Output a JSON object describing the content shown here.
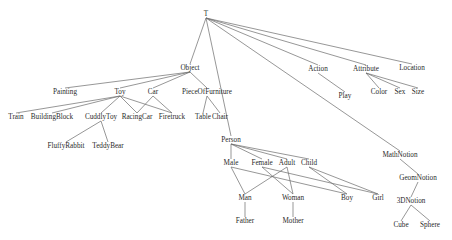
{
  "diagram": {
    "type": "concept-hierarchy-dag",
    "root": "T",
    "nodes": [
      {
        "id": "T",
        "label": "T",
        "x": 206,
        "y": 14
      },
      {
        "id": "Object",
        "label": "Object",
        "x": 190,
        "y": 68
      },
      {
        "id": "Action",
        "label": "Action",
        "x": 318,
        "y": 69
      },
      {
        "id": "Attribute",
        "label": "Attribute",
        "x": 366,
        "y": 69
      },
      {
        "id": "Location",
        "label": "Location",
        "x": 412,
        "y": 68
      },
      {
        "id": "Play",
        "label": "Play",
        "x": 345,
        "y": 96
      },
      {
        "id": "Color",
        "label": "Color",
        "x": 379,
        "y": 92
      },
      {
        "id": "Sex",
        "label": "Sex",
        "x": 400,
        "y": 92
      },
      {
        "id": "Size",
        "label": "Size",
        "x": 418,
        "y": 92
      },
      {
        "id": "Painting",
        "label": "Painting",
        "x": 65,
        "y": 92
      },
      {
        "id": "Toy",
        "label": "Toy",
        "x": 120,
        "y": 92
      },
      {
        "id": "Car",
        "label": "Car",
        "x": 153,
        "y": 92
      },
      {
        "id": "PieceOfFurniture",
        "label": "PieceOfFurniture",
        "x": 207,
        "y": 92
      },
      {
        "id": "Train",
        "label": "Train",
        "x": 16,
        "y": 117
      },
      {
        "id": "BuildingBlock",
        "label": "BuildingBlock",
        "x": 52,
        "y": 117
      },
      {
        "id": "CuddlyToy",
        "label": "CuddlyToy",
        "x": 101,
        "y": 117
      },
      {
        "id": "RacingCar",
        "label": "RacingCar",
        "x": 137,
        "y": 117
      },
      {
        "id": "Firetruck",
        "label": "Firetruck",
        "x": 172,
        "y": 117
      },
      {
        "id": "Table",
        "label": "Table",
        "x": 203,
        "y": 117
      },
      {
        "id": "Chair",
        "label": "Chair",
        "x": 220,
        "y": 117
      },
      {
        "id": "FluffyRabbit",
        "label": "FluffyRabbit",
        "x": 66,
        "y": 146
      },
      {
        "id": "TeddyBear",
        "label": "TeddyBear",
        "x": 108,
        "y": 146
      },
      {
        "id": "Person",
        "label": "Person",
        "x": 231,
        "y": 140
      },
      {
        "id": "Male",
        "label": "Male",
        "x": 231,
        "y": 163
      },
      {
        "id": "Female",
        "label": "Female",
        "x": 262,
        "y": 163
      },
      {
        "id": "Adult",
        "label": "Adult",
        "x": 287,
        "y": 163
      },
      {
        "id": "Child",
        "label": "Child",
        "x": 309,
        "y": 163
      },
      {
        "id": "Man",
        "label": "Man",
        "x": 245,
        "y": 198
      },
      {
        "id": "Woman",
        "label": "Woman",
        "x": 293,
        "y": 198
      },
      {
        "id": "Boy",
        "label": "Boy",
        "x": 347,
        "y": 198
      },
      {
        "id": "Girl",
        "label": "Girl",
        "x": 378,
        "y": 198
      },
      {
        "id": "Father",
        "label": "Father",
        "x": 245,
        "y": 221
      },
      {
        "id": "Mother",
        "label": "Mother",
        "x": 293,
        "y": 221
      },
      {
        "id": "MathNotion",
        "label": "MathNotion",
        "x": 400,
        "y": 155
      },
      {
        "id": "GeomNotion",
        "label": "GeomNotion",
        "x": 418,
        "y": 178
      },
      {
        "id": "3DNotion",
        "label": "3DNotion",
        "x": 411,
        "y": 201
      },
      {
        "id": "Cube",
        "label": "Cube",
        "x": 401,
        "y": 225
      },
      {
        "id": "Sphere",
        "label": "Sphere",
        "x": 430,
        "y": 225
      }
    ],
    "edges": [
      [
        "T",
        "Object"
      ],
      [
        "T",
        "Action"
      ],
      [
        "T",
        "Attribute"
      ],
      [
        "T",
        "Location"
      ],
      [
        "T",
        "Person"
      ],
      [
        "T",
        "MathNotion"
      ],
      [
        "Object",
        "Painting"
      ],
      [
        "Object",
        "Toy"
      ],
      [
        "Object",
        "Car"
      ],
      [
        "Object",
        "PieceOfFurniture"
      ],
      [
        "Action",
        "Play"
      ],
      [
        "Attribute",
        "Color"
      ],
      [
        "Attribute",
        "Sex"
      ],
      [
        "Attribute",
        "Size"
      ],
      [
        "Toy",
        "Train"
      ],
      [
        "Toy",
        "BuildingBlock"
      ],
      [
        "Toy",
        "CuddlyToy"
      ],
      [
        "Toy",
        "RacingCar"
      ],
      [
        "Toy",
        "Firetruck"
      ],
      [
        "Car",
        "RacingCar"
      ],
      [
        "Car",
        "Firetruck"
      ],
      [
        "PieceOfFurniture",
        "Table"
      ],
      [
        "PieceOfFurniture",
        "Chair"
      ],
      [
        "CuddlyToy",
        "FluffyRabbit"
      ],
      [
        "CuddlyToy",
        "TeddyBear"
      ],
      [
        "Person",
        "Male"
      ],
      [
        "Person",
        "Female"
      ],
      [
        "Person",
        "Adult"
      ],
      [
        "Person",
        "Child"
      ],
      [
        "Male",
        "Man"
      ],
      [
        "Male",
        "Boy"
      ],
      [
        "Female",
        "Woman"
      ],
      [
        "Female",
        "Girl"
      ],
      [
        "Adult",
        "Man"
      ],
      [
        "Adult",
        "Woman"
      ],
      [
        "Child",
        "Boy"
      ],
      [
        "Child",
        "Girl"
      ],
      [
        "Man",
        "Father"
      ],
      [
        "Woman",
        "Mother"
      ],
      [
        "MathNotion",
        "GeomNotion"
      ],
      [
        "GeomNotion",
        "3DNotion"
      ],
      [
        "3DNotion",
        "Cube"
      ],
      [
        "3DNotion",
        "Sphere"
      ]
    ]
  }
}
